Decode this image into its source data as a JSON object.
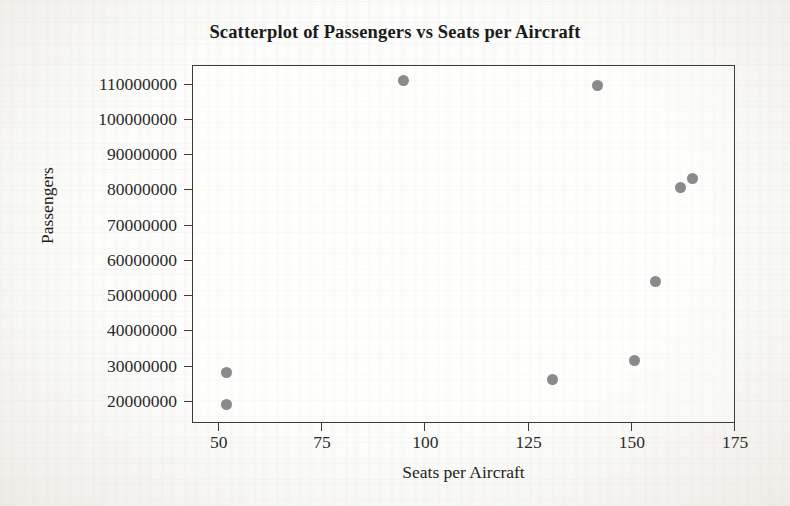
{
  "chart_data": {
    "type": "scatter",
    "title": "Scatterplot of Passengers vs Seats per Aircraft",
    "xlabel": "Seats per Aircraft",
    "ylabel": "Passengers",
    "xlim": [
      44,
      175
    ],
    "ylim": [
      14000000,
      115000000
    ],
    "grid": false,
    "legend": "none",
    "marker_color": "#8a8a8a",
    "xticks": [
      50,
      75,
      100,
      125,
      150,
      175
    ],
    "xtick_labels": [
      "50",
      "75",
      "100",
      "125",
      "150",
      "175"
    ],
    "yticks": [
      20000000,
      30000000,
      40000000,
      50000000,
      60000000,
      70000000,
      80000000,
      90000000,
      100000000,
      110000000
    ],
    "ytick_labels": [
      "20000000",
      "30000000",
      "40000000",
      "50000000",
      "60000000",
      "70000000",
      "80000000",
      "90000000",
      "100000000",
      "110000000"
    ],
    "points": [
      {
        "x": 52,
        "y": 28000000
      },
      {
        "x": 52,
        "y": 19000000
      },
      {
        "x": 95,
        "y": 111000000
      },
      {
        "x": 131,
        "y": 26000000
      },
      {
        "x": 142,
        "y": 109500000
      },
      {
        "x": 151,
        "y": 31500000
      },
      {
        "x": 156,
        "y": 54000000
      },
      {
        "x": 162,
        "y": 80500000
      },
      {
        "x": 165,
        "y": 83000000
      }
    ]
  }
}
